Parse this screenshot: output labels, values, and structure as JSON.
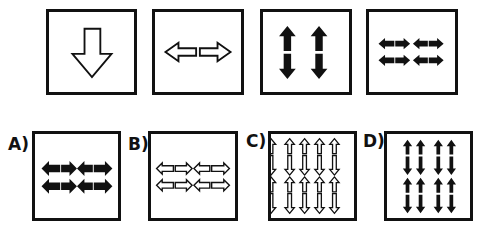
{
  "puzzle": {
    "sequence": [
      {
        "id": "seq-1",
        "description": "single large outlined down arrow"
      },
      {
        "id": "seq-2",
        "description": "outlined left and right arrows"
      },
      {
        "id": "seq-3",
        "description": "two black vertical up/down arrow pairs"
      },
      {
        "id": "seq-4",
        "description": "two rows of black left/right arrow pairs"
      }
    ],
    "options": [
      {
        "label": "A)",
        "description": "2x2 black horizontal arrow pairs"
      },
      {
        "label": "B)",
        "description": "2x2 outlined horizontal arrow pairs"
      },
      {
        "label": "C)",
        "description": "4x2 outlined vertical arrow pairs"
      },
      {
        "label": "D)",
        "description": "4x2 black vertical arrow pairs"
      }
    ]
  }
}
